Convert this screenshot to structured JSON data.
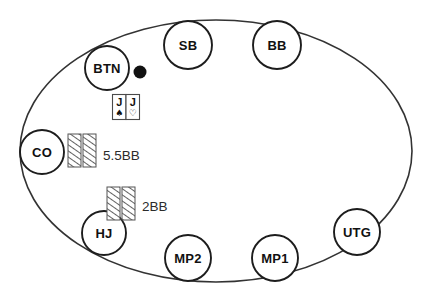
{
  "diagram": {
    "table_shape": "oval",
    "stroke_color": "#333333",
    "fill_color": "#ffffff",
    "seats": [
      {
        "id": "btn",
        "label": "BTN",
        "cx": 107,
        "cy": 68,
        "r": 22
      },
      {
        "id": "sb",
        "label": "SB",
        "cx": 188,
        "cy": 45,
        "r": 24
      },
      {
        "id": "bb",
        "label": "BB",
        "cx": 277,
        "cy": 45,
        "r": 24
      },
      {
        "id": "utg",
        "label": "UTG",
        "cx": 357,
        "cy": 232,
        "r": 23
      },
      {
        "id": "mp1",
        "label": "MP1",
        "cx": 275,
        "cy": 258,
        "r": 23
      },
      {
        "id": "mp2",
        "label": "MP2",
        "cx": 188,
        "cy": 258,
        "r": 23
      },
      {
        "id": "hj",
        "label": "HJ",
        "cx": 104,
        "cy": 233,
        "r": 22
      },
      {
        "id": "co",
        "label": "CO",
        "cx": 42,
        "cy": 152,
        "r": 22
      }
    ],
    "dealer_button": {
      "cx": 140,
      "cy": 72,
      "r": 6.5,
      "color": "#111111"
    },
    "hole_cards": [
      {
        "rank": "J",
        "suit": "spade",
        "symbol": "♠",
        "filled": true
      },
      {
        "rank": "J",
        "suit": "heart",
        "symbol": "♡",
        "filled": false
      }
    ],
    "bets": [
      {
        "id": "co-bet",
        "amount": "5.5BB",
        "seat": "CO",
        "chips": 2,
        "label_x": 103,
        "label_y": 155
      },
      {
        "id": "hj-bet",
        "amount": "2BB",
        "seat": "HJ",
        "chips": 2,
        "label_x": 142,
        "label_y": 206
      }
    ]
  }
}
